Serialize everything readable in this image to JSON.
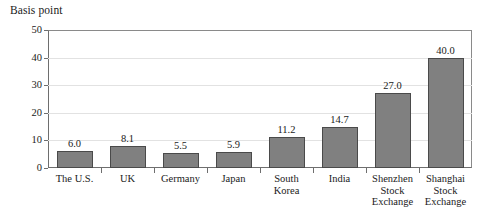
{
  "chart_data": {
    "type": "bar",
    "title": "",
    "ylabel": "Basis point",
    "xlabel": "",
    "ylim": [
      0,
      50
    ],
    "yticks": [
      0,
      10,
      20,
      30,
      40,
      50
    ],
    "grid": true,
    "legend": "none",
    "bar_color": "#808080",
    "bar_edge_color": "#4a4a4a",
    "gridline_color": "#e2e2e2",
    "axis_color": "#6e6e6e",
    "categories": [
      "The U.S.",
      "UK",
      "Germany",
      "Japan",
      "South\nKorea",
      "India",
      "Shenzhen\nStock\nExchange",
      "Shanghai\nStock\nExchange"
    ],
    "values": [
      6.0,
      8.1,
      5.5,
      5.9,
      11.2,
      14.7,
      27.0,
      40.0
    ],
    "data_labels": [
      "6.0",
      "8.1",
      "5.5",
      "5.9",
      "11.2",
      "14.7",
      "27.0",
      "40.0"
    ],
    "ytick_labels": [
      "0",
      "10",
      "20",
      "30",
      "40",
      "50"
    ]
  }
}
